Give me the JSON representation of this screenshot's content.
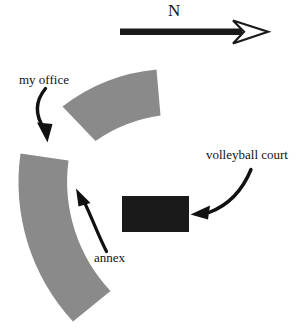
{
  "figure": {
    "type": "site-map-sketch",
    "background_color": "#ffffff",
    "width": 301,
    "height": 335
  },
  "compass": {
    "direction_label": "N",
    "arrow_name": "north-arrow",
    "arrow_color": "#1a1a1a",
    "arrowhead_style": "hollow-outline",
    "shaft_from_x": 120,
    "shaft_to_x": 240,
    "shaft_y": 32
  },
  "shapes": {
    "my_office_building": {
      "name": "my office",
      "shape": "annular-sector",
      "fill_color": "#8a8a8a"
    },
    "annex_building": {
      "name": "annex",
      "shape": "annular-sector",
      "fill_color": "#8a8a8a"
    },
    "volleyball_court": {
      "name": "volleyball court",
      "shape": "rectangle",
      "fill_color": "#1a1a1a",
      "x": 122,
      "y": 196,
      "width": 67,
      "height": 36
    }
  },
  "labels": {
    "north": "N",
    "my_office": "my office",
    "volleyball_court": "volleyball court",
    "annex": "annex"
  },
  "leader_arrows": [
    {
      "name": "my-office-leader-arrow",
      "from": "my office label",
      "to": "upper annular band",
      "color": "#111111"
    },
    {
      "name": "annex-leader-arrow",
      "from": "annex label",
      "to": "lower annular band",
      "color": "#111111"
    },
    {
      "name": "volleyball-court-leader-arrow",
      "from": "volleyball court label",
      "to": "black rectangle",
      "color": "#111111"
    }
  ]
}
